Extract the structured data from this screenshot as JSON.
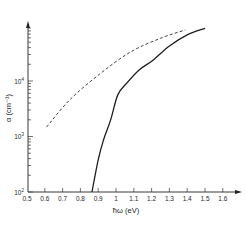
{
  "chart_data": {
    "type": "line",
    "title": "",
    "xlabel": "ħω (eV)",
    "ylabel": "α (cm⁻¹)",
    "xlim": [
      0.5,
      1.6
    ],
    "ylim_log10": [
      2,
      5
    ],
    "yscale": "log",
    "grid": false,
    "legend": null,
    "x_ticks": [
      "0.5",
      "0.6",
      "0.7",
      "0.8",
      "0.9",
      "1",
      "1.1",
      "1.2",
      "1.3",
      "1.4",
      "1.5",
      "1.6"
    ],
    "y_ticks": [
      "10²",
      "10³",
      "10⁴"
    ],
    "series": [
      {
        "name": "solid",
        "style": "solid",
        "x": [
          0.865,
          0.9,
          0.93,
          0.97,
          1.01,
          1.06,
          1.13,
          1.21,
          1.3,
          1.4,
          1.5
        ],
        "log10_alpha": [
          2.0,
          2.58,
          2.94,
          3.3,
          3.75,
          3.96,
          4.2,
          4.38,
          4.63,
          4.83,
          4.95
        ]
      },
      {
        "name": "dashed",
        "style": "dashed",
        "x": [
          0.61,
          0.74,
          0.91,
          1.08,
          1.25,
          1.39
        ],
        "log10_alpha": [
          3.17,
          3.66,
          4.13,
          4.52,
          4.77,
          4.92
        ]
      }
    ]
  },
  "axes": {
    "x_title": "ħω (eV)",
    "y_title": "α (cm⁻¹)",
    "y_tick_labels": [
      {
        "base": "10",
        "exp": "2"
      },
      {
        "base": "10",
        "exp": "3"
      },
      {
        "base": "10",
        "exp": "4"
      }
    ]
  }
}
